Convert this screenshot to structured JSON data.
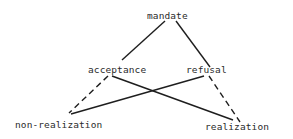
{
  "diagram": {
    "type": "square-of-opposition",
    "nodes": {
      "mandate": "mandate",
      "acceptance": "acceptance",
      "refusal": "refusal",
      "non_realization": "non-realization",
      "realization": "realization"
    },
    "edges": [
      {
        "from": "mandate",
        "to": "acceptance",
        "style": "solid"
      },
      {
        "from": "mandate",
        "to": "refusal",
        "style": "solid"
      },
      {
        "from": "acceptance",
        "to": "non_realization",
        "style": "dashed"
      },
      {
        "from": "refusal",
        "to": "realization",
        "style": "dashed"
      },
      {
        "from": "acceptance",
        "to": "realization",
        "style": "solid"
      },
      {
        "from": "refusal",
        "to": "non_realization",
        "style": "solid"
      }
    ],
    "colors": {
      "line": "#1e1e1e",
      "text": "#2b2b2b",
      "background": "#ffffff"
    }
  }
}
